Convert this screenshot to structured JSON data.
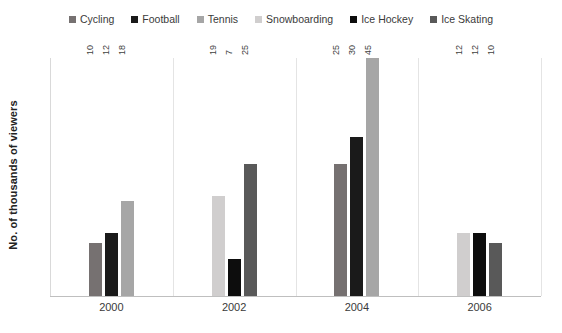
{
  "chart_data": {
    "type": "bar",
    "title": "",
    "subtitle": "",
    "xlabel": "",
    "ylabel": "No. of thousands of viewers",
    "categories": [
      "2000",
      "2002",
      "2004",
      "2006"
    ],
    "ylim": [
      0,
      45
    ],
    "grid": false,
    "legend_position": "top",
    "orientation": "vertical",
    "data_labels": true,
    "series": [
      {
        "name": "Cycling",
        "color": "#767171",
        "values": [
          10,
          null,
          25,
          null
        ]
      },
      {
        "name": "Football",
        "color": "#1a1a1a",
        "values": [
          12,
          null,
          30,
          null
        ]
      },
      {
        "name": "Tennis",
        "color": "#a6a6a6",
        "values": [
          18,
          null,
          45,
          null
        ]
      },
      {
        "name": "Snowboarding",
        "color": "#d0cece",
        "values": [
          null,
          19,
          null,
          12
        ]
      },
      {
        "name": "Ice Hockey",
        "color": "#0d0d0d",
        "values": [
          null,
          7,
          null,
          12
        ]
      },
      {
        "name": "Ice Skating",
        "color": "#595959",
        "values": [
          null,
          25,
          null,
          10
        ]
      }
    ],
    "groups": [
      {
        "category": "2000",
        "bars": [
          {
            "series": "Cycling",
            "value": 10,
            "label": "10",
            "color": "#767171"
          },
          {
            "series": "Football",
            "value": 12,
            "label": "12",
            "color": "#1a1a1a"
          },
          {
            "series": "Tennis",
            "value": 18,
            "label": "18",
            "color": "#a6a6a6"
          }
        ]
      },
      {
        "category": "2002",
        "bars": [
          {
            "series": "Snowboarding",
            "value": 19,
            "label": "19",
            "color": "#d0cece"
          },
          {
            "series": "Ice Hockey",
            "value": 7,
            "label": "7",
            "color": "#0d0d0d"
          },
          {
            "series": "Ice Skating",
            "value": 25,
            "label": "25",
            "color": "#595959"
          }
        ]
      },
      {
        "category": "2004",
        "bars": [
          {
            "series": "Cycling",
            "value": 25,
            "label": "25",
            "color": "#767171"
          },
          {
            "series": "Football",
            "value": 30,
            "label": "30",
            "color": "#1a1a1a"
          },
          {
            "series": "Tennis",
            "value": 45,
            "label": "45",
            "color": "#a6a6a6"
          }
        ]
      },
      {
        "category": "2006",
        "bars": [
          {
            "series": "Snowboarding",
            "value": 12,
            "label": "12",
            "color": "#d0cece"
          },
          {
            "series": "Ice Hockey",
            "value": 12,
            "label": "12",
            "color": "#0d0d0d"
          },
          {
            "series": "Ice Skating",
            "value": 10,
            "label": "10",
            "color": "#595959"
          }
        ]
      }
    ]
  },
  "legend": {
    "items": [
      {
        "label": "Cycling",
        "color": "#767171"
      },
      {
        "label": "Football",
        "color": "#1a1a1a"
      },
      {
        "label": "Tennis",
        "color": "#a6a6a6"
      },
      {
        "label": "Snowboarding",
        "color": "#d0cece"
      },
      {
        "label": "Ice Hockey",
        "color": "#0d0d0d"
      },
      {
        "label": "Ice Skating",
        "color": "#595959"
      }
    ]
  },
  "axes": {
    "y_title": "No. of thousands of viewers",
    "x_tick_labels": [
      "2000",
      "2002",
      "2004",
      "2006"
    ]
  }
}
